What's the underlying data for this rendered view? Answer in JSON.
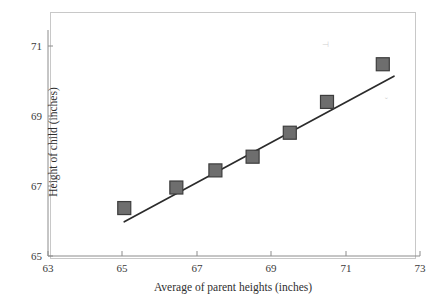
{
  "figure": {
    "background_color": "#ffffff",
    "frame_color": "#c8c8c8",
    "marker_fill_color": "#6e6e6e",
    "marker_edge_color": "#3d3d3d",
    "line_color": "#2b2b2b",
    "axis_color": "#8c8c8c"
  },
  "chart_data": {
    "type": "scatter",
    "title": "",
    "xlabel": "Average of parent heights (inches)",
    "ylabel": "Height of child (inches)",
    "xlim": [
      63,
      73
    ],
    "ylim": [
      65,
      71.6
    ],
    "xticks": [
      63,
      65,
      67,
      69,
      71,
      73
    ],
    "xtick_labels": [
      "63",
      "65",
      "67",
      "69",
      "71",
      "73"
    ],
    "yticks": [
      65,
      67,
      69,
      71
    ],
    "ytick_labels": [
      "65",
      "67",
      "69",
      "71"
    ],
    "grid": false,
    "legend": null,
    "series": [
      {
        "name": "Parent height vs child height",
        "marker": "square",
        "x": [
          65.05,
          66.45,
          67.5,
          68.5,
          69.5,
          70.5,
          72.0
        ],
        "y": [
          66.4,
          67.0,
          67.5,
          67.9,
          68.6,
          69.5,
          70.6
        ],
        "points": [
          {
            "x": 65.05,
            "y": 66.4
          },
          {
            "x": 66.45,
            "y": 67.0
          },
          {
            "x": 67.5,
            "y": 67.5
          },
          {
            "x": 68.5,
            "y": 67.9
          },
          {
            "x": 69.5,
            "y": 68.6
          },
          {
            "x": 70.5,
            "y": 69.5
          },
          {
            "x": 72.0,
            "y": 70.6
          }
        ]
      }
    ],
    "fit_line": {
      "name": "regression line",
      "x_start": 65.05,
      "y_start": 66.0,
      "x_end": 72.3,
      "y_end": 70.25
    },
    "annotations": []
  },
  "specks": [
    {
      "glyph": "⊣",
      "left": 322,
      "top": 40
    },
    {
      "glyph": "ˇ",
      "left": 385,
      "top": 97
    }
  ]
}
